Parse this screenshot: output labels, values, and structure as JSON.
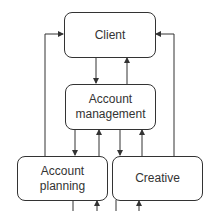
{
  "diagram": {
    "nodes": [
      {
        "id": "client",
        "label": "Client"
      },
      {
        "id": "account_management",
        "label": "Account\nmanagement"
      },
      {
        "id": "account_planning",
        "label": "Account\nplanning"
      },
      {
        "id": "creative",
        "label": "Creative"
      }
    ],
    "edges": [
      {
        "from": "client",
        "to": "account_management"
      },
      {
        "from": "account_management",
        "to": "client"
      },
      {
        "from": "account_management",
        "to": "account_planning"
      },
      {
        "from": "account_planning",
        "to": "account_management"
      },
      {
        "from": "account_management",
        "to": "creative"
      },
      {
        "from": "creative",
        "to": "account_management"
      },
      {
        "from": "account_planning",
        "to": "client"
      },
      {
        "from": "creative",
        "to": "client"
      }
    ],
    "colors": {
      "line": "#333333",
      "text": "#333333",
      "background": "#ffffff"
    }
  }
}
